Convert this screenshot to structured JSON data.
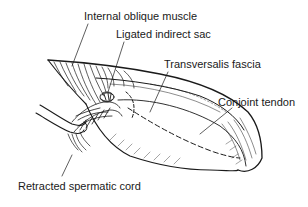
{
  "diagram": {
    "colors": {
      "ink": "#1a1a1a",
      "background": "#ffffff"
    },
    "labels": [
      {
        "id": "internal-oblique-muscle",
        "text": "Internal oblique muscle",
        "x": 84,
        "y": 10
      },
      {
        "id": "ligated-indirect-sac",
        "text": "Ligated indirect sac",
        "x": 116,
        "y": 28
      },
      {
        "id": "transversalis-fascia",
        "text": "Transversalis fascia",
        "x": 164,
        "y": 58
      },
      {
        "id": "conjoint-tendon",
        "text": "Conjoint tendon",
        "x": 218,
        "y": 96
      },
      {
        "id": "retracted-spermatic-cord",
        "text": "Retracted spermatic cord",
        "x": 18,
        "y": 180
      }
    ]
  }
}
